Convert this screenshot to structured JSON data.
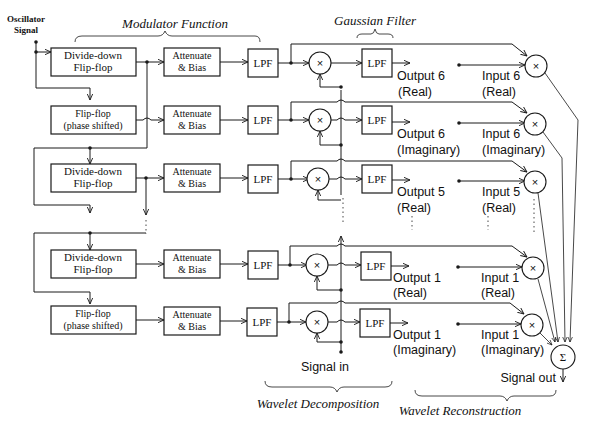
{
  "diagram": {
    "oscillator_label": [
      "Oscillator",
      "Signal"
    ],
    "section_titles": {
      "modulator": "Modulator Function",
      "gaussian": "Gaussian Filter",
      "decomposition": "Wavelet Decomposition",
      "reconstruction": "Wavelet Reconstruction"
    },
    "blocks": {
      "divide_down": [
        "Divide-down",
        "Flip-flop"
      ],
      "phase_shifted": [
        "Flip-flop",
        "(phase shifted)"
      ],
      "attenuate": [
        "Attenuate",
        "& Bias"
      ],
      "lpf": "LPF"
    },
    "symbols": {
      "multiply": "×",
      "sum": "Σ",
      "ellipsis": "⋮"
    },
    "rows": [
      {
        "flipflop": "divide_down",
        "output": [
          "Output 6",
          "(Real)"
        ],
        "input": [
          "Input 6",
          "(Real)"
        ]
      },
      {
        "flipflop": "phase_shifted",
        "output": [
          "Output 6",
          "(Imaginary)"
        ],
        "input": [
          "Input 6",
          "(Imaginary)"
        ]
      },
      {
        "flipflop": "divide_down",
        "output": [
          "Output 5",
          "(Real)"
        ],
        "input": [
          "Input 5",
          "(Real)"
        ]
      },
      {
        "flipflop": "divide_down",
        "output": [
          "Output 1",
          "(Real)"
        ],
        "input": [
          "Input 1",
          "(Real)"
        ]
      },
      {
        "flipflop": "phase_shifted",
        "output": [
          "Output 1",
          "(Imaginary)"
        ],
        "input": [
          "Input 1",
          "(Imaginary)"
        ]
      }
    ],
    "signal_in": "Signal in",
    "signal_out": "Signal out"
  }
}
